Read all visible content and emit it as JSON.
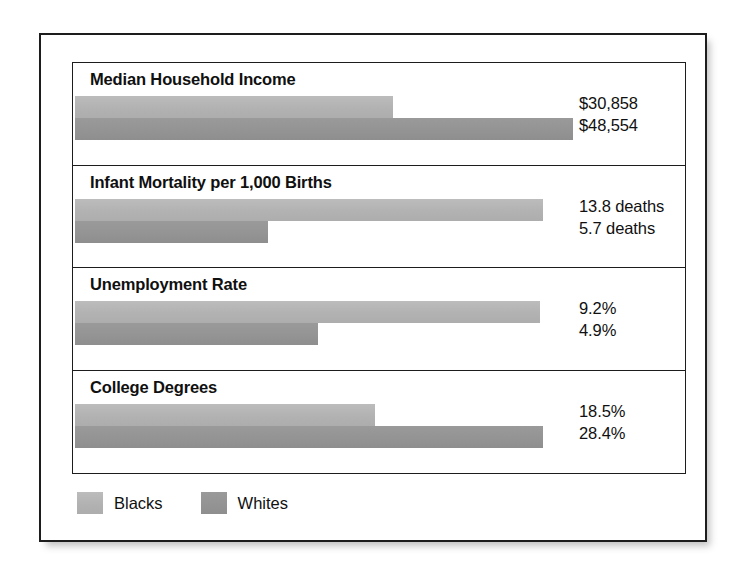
{
  "chart_data": {
    "type": "bar",
    "title": "",
    "orientation": "horizontal",
    "grid": false,
    "legend_position": "bottom-left",
    "categories": [
      "Median Household Income",
      "Infant Mortality per 1,000 Births",
      "Unemployment Rate",
      "College Degrees"
    ],
    "series": [
      {
        "name": "Blacks",
        "color": "#b4b4b4",
        "values": [
          30858,
          13.8,
          9.2,
          18.5
        ],
        "value_labels": [
          "$30,858",
          "13.8 deaths",
          "9.2%",
          "18.5%"
        ]
      },
      {
        "name": "Whites",
        "color": "#949494",
        "values": [
          48554,
          5.7,
          4.9,
          28.4
        ],
        "value_labels": [
          "$48,554",
          "5.7 deaths",
          "4.9%",
          "28.4%"
        ]
      }
    ],
    "panels": [
      {
        "title": "Median Household Income",
        "blacks_label": "$30,858",
        "whites_label": "$48,554",
        "blacks_bar_width": "318px",
        "whites_bar_width": "498px"
      },
      {
        "title": "Infant Mortality per 1,000 Births",
        "blacks_label": "13.8 deaths",
        "whites_label": "5.7 deaths",
        "blacks_bar_width": "468px",
        "whites_bar_width": "193px"
      },
      {
        "title": "Unemployment Rate",
        "blacks_label": "9.2%",
        "whites_label": "4.9%",
        "blacks_bar_width": "465px",
        "whites_bar_width": "243px"
      },
      {
        "title": "College Degrees",
        "blacks_label": "18.5%",
        "whites_label": "28.4%",
        "blacks_bar_width": "300px",
        "whites_bar_width": "468px"
      }
    ],
    "legend": [
      {
        "label": "Blacks",
        "color": "#b4b4b4"
      },
      {
        "label": "Whites",
        "color": "#949494"
      }
    ]
  }
}
